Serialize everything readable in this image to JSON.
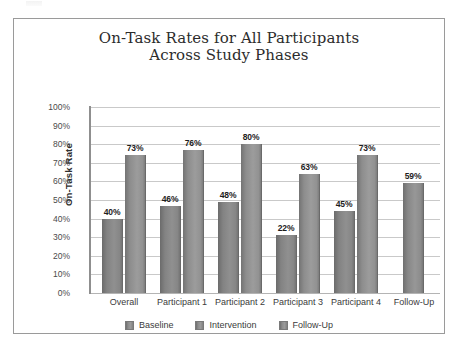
{
  "figure": {
    "border_color": "#9a9a9a",
    "background": "#ffffff"
  },
  "chart_data": {
    "type": "bar",
    "title": "On-Task Rates for All Participants Across Study Phases",
    "title_lines": [
      "On-Task Rates for All Participants",
      "Across Study Phases"
    ],
    "xlabel": "",
    "ylabel": "On-Task Rate",
    "ylim": [
      0,
      100
    ],
    "ytick_labels": [
      "100%",
      "90%",
      "80%",
      "70%",
      "60%",
      "50%",
      "40%",
      "30%",
      "20%",
      "10%",
      "0%"
    ],
    "ytick_values": [
      100,
      90,
      80,
      70,
      60,
      50,
      40,
      30,
      20,
      10,
      0
    ],
    "grid": "horizontal",
    "legend_position": "bottom",
    "categories": [
      "Overall",
      "Participant 1",
      "Participant 2",
      "Participant 3",
      "Participant 4",
      "Follow-Up"
    ],
    "series": [
      {
        "name": "Baseline",
        "color": "#8a8a8a",
        "values": [
          40,
          46,
          48,
          22,
          45,
          null
        ],
        "labels": [
          "40%",
          "46%",
          "48%",
          "22%",
          "45%",
          ""
        ]
      },
      {
        "name": "Intervention",
        "color": "#9a9a9a",
        "values": [
          73,
          76,
          80,
          63,
          73,
          null
        ],
        "labels": [
          "73%",
          "76%",
          "80%",
          "63%",
          "73%",
          ""
        ]
      },
      {
        "name": "Follow-Up",
        "color": "#909090",
        "values": [
          null,
          null,
          null,
          null,
          null,
          59
        ],
        "labels": [
          "",
          "",
          "",
          "",
          "",
          "59%"
        ]
      }
    ],
    "bars": [
      {
        "category": "Overall",
        "series": "Baseline",
        "value": 40,
        "label": "40%",
        "x": 11,
        "width": 21,
        "draw_height": 40
      },
      {
        "category": "Overall",
        "series": "Intervention",
        "value": 73,
        "label": "73%",
        "x": 34,
        "width": 21,
        "draw_height": 74
      },
      {
        "category": "Participant 1",
        "series": "Baseline",
        "value": 46,
        "label": "46%",
        "x": 69,
        "width": 21,
        "draw_height": 47
      },
      {
        "category": "Participant 1",
        "series": "Intervention",
        "value": 76,
        "label": "76%",
        "x": 92,
        "width": 21,
        "draw_height": 77
      },
      {
        "category": "Participant 2",
        "series": "Baseline",
        "value": 48,
        "label": "48%",
        "x": 127,
        "width": 21,
        "draw_height": 49
      },
      {
        "category": "Participant 2",
        "series": "Intervention",
        "value": 80,
        "label": "80%",
        "x": 150,
        "width": 21,
        "draw_height": 80
      },
      {
        "category": "Participant 3",
        "series": "Baseline",
        "value": 22,
        "label": "22%",
        "x": 185,
        "width": 21,
        "draw_height": 31
      },
      {
        "category": "Participant 3",
        "series": "Intervention",
        "value": 63,
        "label": "63%",
        "x": 208,
        "width": 21,
        "draw_height": 64
      },
      {
        "category": "Participant 4",
        "series": "Baseline",
        "value": 45,
        "label": "45%",
        "x": 243,
        "width": 21,
        "draw_height": 44
      },
      {
        "category": "Participant 4",
        "series": "Intervention",
        "value": 73,
        "label": "73%",
        "x": 266,
        "width": 21,
        "draw_height": 74
      },
      {
        "category": "Follow-Up",
        "series": "Follow-Up",
        "value": 59,
        "label": "59%",
        "x": 312,
        "width": 21,
        "draw_height": 59
      }
    ],
    "legend": [
      {
        "name": "Baseline",
        "color": "#8a8a8a"
      },
      {
        "name": "Intervention",
        "color": "#9a9a9a"
      },
      {
        "name": "Follow-Up",
        "color": "#909090"
      }
    ]
  }
}
